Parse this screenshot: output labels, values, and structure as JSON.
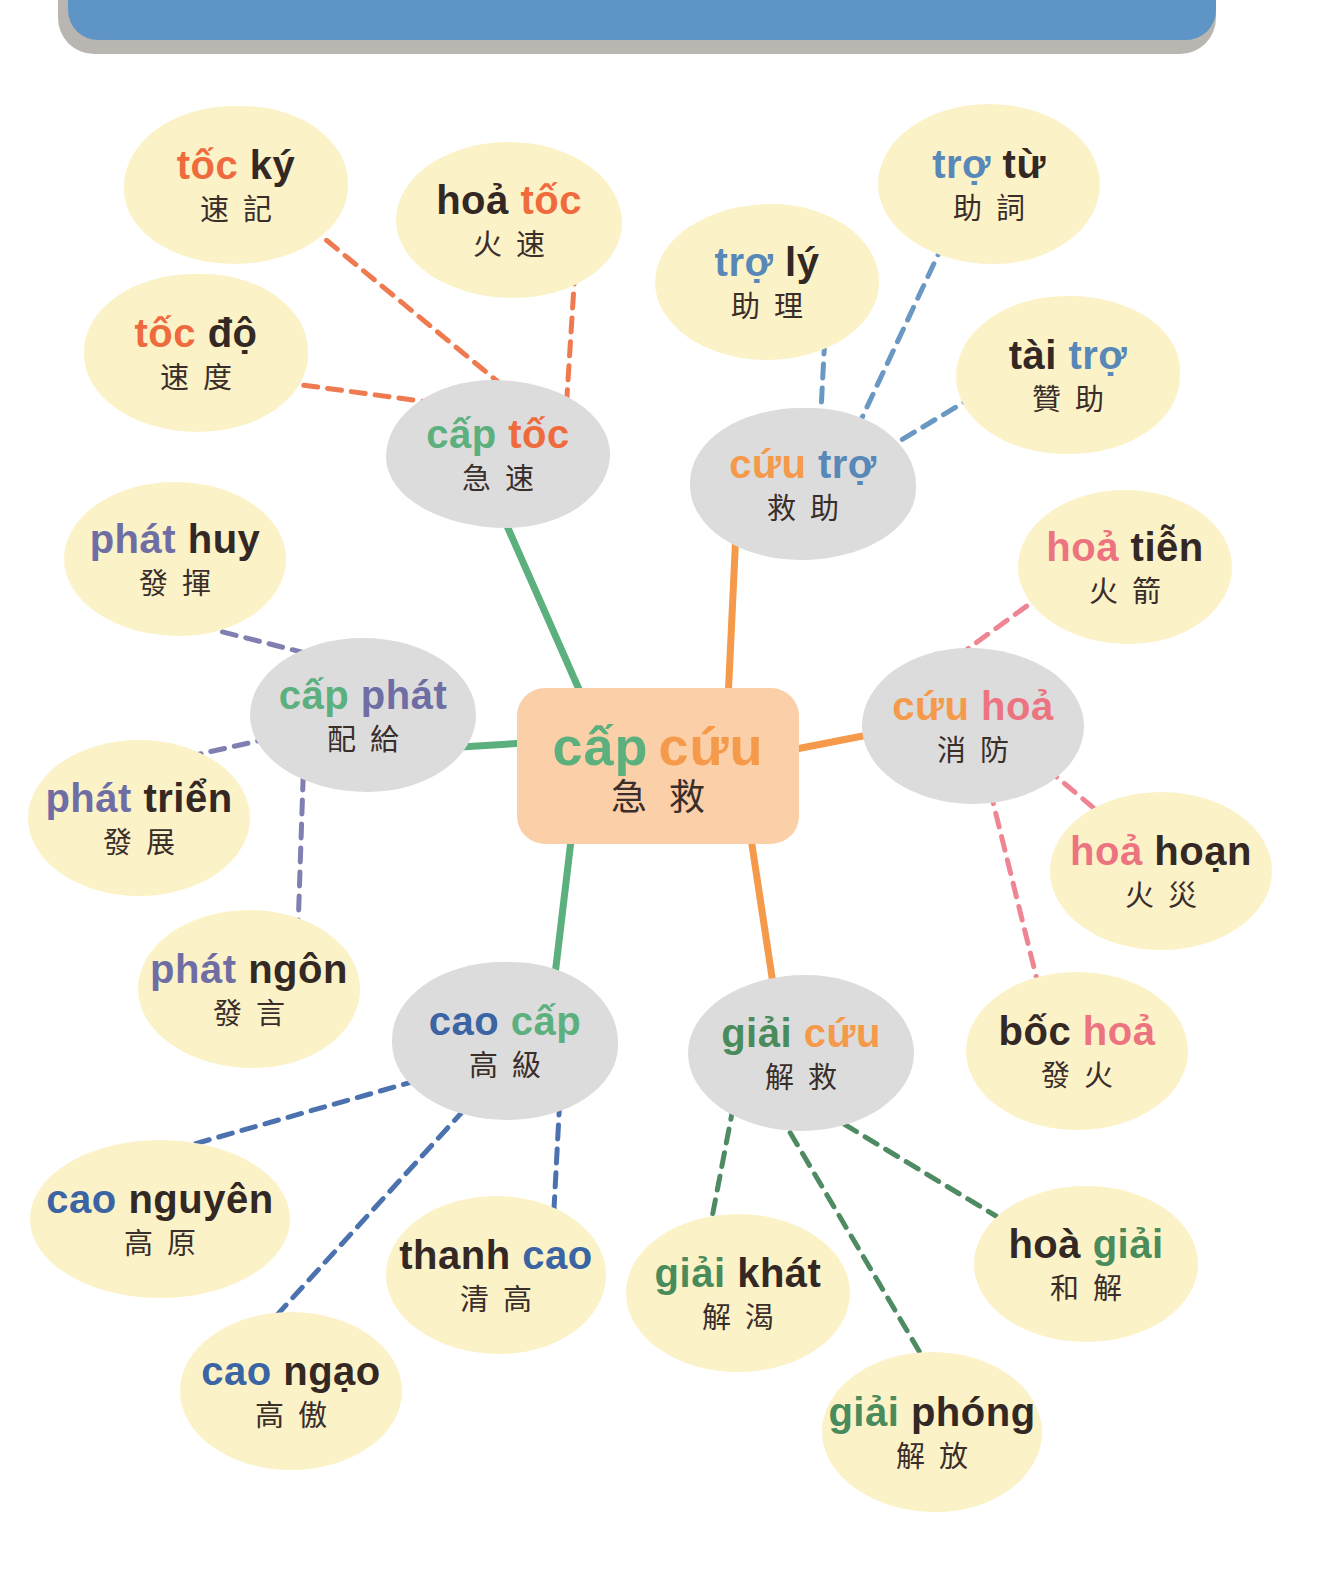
{
  "colors": {
    "banner": "#5e95c6",
    "banner_shadow": "#b9b6b2",
    "leaf_bg": "#fcf2c8",
    "hub_bg": "#dcdcdc",
    "center_bg": "#fbcfa7",
    "dark_text": "#332824",
    "cap_green": "#5bb07e",
    "cuu_orange": "#f59a4a",
    "toc_orange": "#ef6a3c",
    "tro_blue": "#5888b8",
    "hoa_pink": "#ec7480",
    "phat_purple": "#6f6ea4",
    "cao_blue": "#3a64a4",
    "giai_green": "#4a8b5c"
  },
  "center": {
    "word1": "cấp",
    "word1_color": "#5bb07e",
    "word2": "cứu",
    "word2_color": "#f59a4a",
    "hanzi": "急救"
  },
  "hubs": [
    {
      "id": "cap-toc",
      "word1": "cấp",
      "word2": "tốc",
      "hanzi": "急速"
    },
    {
      "id": "cuu-tro",
      "word1": "cứu",
      "word2": "trợ",
      "hanzi": "救助"
    },
    {
      "id": "cap-phat",
      "word1": "cấp",
      "word2": "phát",
      "hanzi": "配給"
    },
    {
      "id": "cuu-hoa",
      "word1": "cứu",
      "word2": "hoả",
      "hanzi": "消防"
    },
    {
      "id": "cao-cap",
      "word1": "cao",
      "word2": "cấp",
      "hanzi": "高級"
    },
    {
      "id": "giai-cuu",
      "word1": "giải",
      "word2": "cứu",
      "hanzi": "解救"
    }
  ],
  "leaves": [
    {
      "id": "toc-ky",
      "word1": "tốc",
      "word2": "ký",
      "hanzi": "速記",
      "hub": "cap-toc"
    },
    {
      "id": "hoa-toc",
      "word1": "hoả",
      "word2": "tốc",
      "hanzi": "火速",
      "hub": "cap-toc"
    },
    {
      "id": "toc-do",
      "word1": "tốc",
      "word2": "độ",
      "hanzi": "速度",
      "hub": "cap-toc"
    },
    {
      "id": "tro-tu",
      "word1": "trợ",
      "word2": "từ",
      "hanzi": "助詞",
      "hub": "cuu-tro"
    },
    {
      "id": "tro-ly",
      "word1": "trợ",
      "word2": "lý",
      "hanzi": "助理",
      "hub": "cuu-tro"
    },
    {
      "id": "tai-tro",
      "word1": "tài",
      "word2": "trợ",
      "hanzi": "贊助",
      "hub": "cuu-tro"
    },
    {
      "id": "phat-huy",
      "word1": "phát",
      "word2": "huy",
      "hanzi": "發揮",
      "hub": "cap-phat"
    },
    {
      "id": "phat-trien",
      "word1": "phát",
      "word2": "triển",
      "hanzi": "發展",
      "hub": "cap-phat"
    },
    {
      "id": "phat-ngon",
      "word1": "phát",
      "word2": "ngôn",
      "hanzi": "發言",
      "hub": "cap-phat"
    },
    {
      "id": "hoa-tien",
      "word1": "hoả",
      "word2": "tiễn",
      "hanzi": "火箭",
      "hub": "cuu-hoa"
    },
    {
      "id": "hoa-hoan",
      "word1": "hoả",
      "word2": "hoạn",
      "hanzi": "火災",
      "hub": "cuu-hoa"
    },
    {
      "id": "boc-hoa",
      "word1": "bốc",
      "word2": "hoả",
      "hanzi": "發火",
      "hub": "cuu-hoa"
    },
    {
      "id": "cao-nguyen",
      "word1": "cao",
      "word2": "nguyên",
      "hanzi": "高原",
      "hub": "cao-cap"
    },
    {
      "id": "thanh-cao",
      "word1": "thanh",
      "word2": "cao",
      "hanzi": "清高",
      "hub": "cao-cap"
    },
    {
      "id": "cao-ngao",
      "word1": "cao",
      "word2": "ngạo",
      "hanzi": "高傲",
      "hub": "cao-cap"
    },
    {
      "id": "giai-khat",
      "word1": "giải",
      "word2": "khát",
      "hanzi": "解渴",
      "hub": "giai-cuu"
    },
    {
      "id": "giai-phong",
      "word1": "giải",
      "word2": "phóng",
      "hanzi": "解放",
      "hub": "giai-cuu"
    },
    {
      "id": "hoa-giai",
      "word1": "hoà",
      "word2": "giải",
      "hanzi": "和解",
      "hub": "giai-cuu"
    }
  ]
}
